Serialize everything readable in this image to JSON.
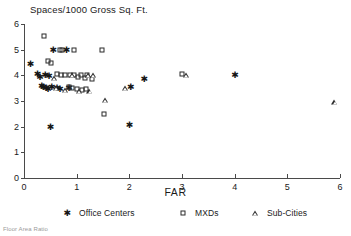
{
  "chart_data": {
    "type": "scatter",
    "title": "Spaces/1000 Gross Sq. Ft.",
    "xlabel": "FAR",
    "ylabel": "",
    "xlim": [
      0,
      6
    ],
    "ylim": [
      0,
      6
    ],
    "grid": false,
    "legend_position": "bottom",
    "xticks": [
      "0",
      "1",
      "2",
      "3",
      "4",
      "5",
      "6"
    ],
    "yticks": [
      "0",
      "1",
      "2",
      "3",
      "4",
      "5",
      "6"
    ],
    "footnote": "Floor Area Ratio",
    "series": [
      {
        "name": "Office Centers",
        "marker": "filled-star",
        "points": [
          [
            0.12,
            4.45
          ],
          [
            0.25,
            4.05
          ],
          [
            0.3,
            3.95
          ],
          [
            0.33,
            3.6
          ],
          [
            0.36,
            3.55
          ],
          [
            0.4,
            4.0
          ],
          [
            0.42,
            3.52
          ],
          [
            0.45,
            3.48
          ],
          [
            0.47,
            3.98
          ],
          [
            0.5,
            2.0
          ],
          [
            0.52,
            3.55
          ],
          [
            0.55,
            5.0
          ],
          [
            0.62,
            3.5
          ],
          [
            0.68,
            3.45
          ],
          [
            0.8,
            5.0
          ],
          [
            0.85,
            3.52
          ],
          [
            2.0,
            2.05
          ],
          [
            2.02,
            3.55
          ],
          [
            2.28,
            3.85
          ],
          [
            4.0,
            4.0
          ]
        ]
      },
      {
        "name": "MXDs",
        "marker": "open-square",
        "points": [
          [
            0.38,
            5.55
          ],
          [
            0.68,
            5.0
          ],
          [
            0.72,
            5.0
          ],
          [
            0.95,
            5.0
          ],
          [
            0.45,
            4.55
          ],
          [
            0.52,
            4.5
          ],
          [
            0.62,
            4.05
          ],
          [
            0.7,
            4.0
          ],
          [
            0.78,
            4.0
          ],
          [
            0.88,
            4.02
          ],
          [
            0.95,
            4.0
          ],
          [
            1.02,
            3.95
          ],
          [
            1.08,
            4.0
          ],
          [
            1.15,
            3.9
          ],
          [
            1.2,
            4.0
          ],
          [
            0.85,
            3.55
          ],
          [
            0.92,
            3.5
          ],
          [
            1.0,
            3.45
          ],
          [
            1.1,
            3.42
          ],
          [
            1.18,
            3.48
          ],
          [
            1.3,
            3.85
          ],
          [
            1.48,
            5.0
          ],
          [
            1.52,
            2.5
          ],
          [
            3.0,
            4.05
          ]
        ]
      },
      {
        "name": "Sub-Cities",
        "marker": "open-triangle",
        "points": [
          [
            0.58,
            3.9
          ],
          [
            0.92,
            4.0
          ],
          [
            1.22,
            4.0
          ],
          [
            1.32,
            4.0
          ],
          [
            0.62,
            3.5
          ],
          [
            0.78,
            3.42
          ],
          [
            1.05,
            3.4
          ],
          [
            1.25,
            3.4
          ],
          [
            1.55,
            3.05
          ],
          [
            1.92,
            3.52
          ],
          [
            3.08,
            4.0
          ],
          [
            5.9,
            2.95
          ]
        ]
      }
    ]
  }
}
